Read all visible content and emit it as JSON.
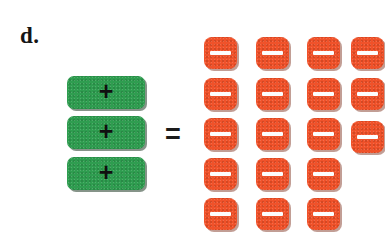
{
  "page": {
    "background_color": "#ffffff",
    "width": 385,
    "height": 248
  },
  "problem": {
    "label": "d.",
    "equals_symbol": "=",
    "description": "algebra tile equation: three positive tiles equal eighteen negative tiles"
  },
  "colors": {
    "positive_tile": "#2f9d50",
    "negative_tile": "#f0522a",
    "positive_sign": "#101010",
    "negative_sign": "#fdfdfd",
    "text": "#151515"
  },
  "left_side": {
    "name": "positive-tile-stack",
    "tile_type": "positive",
    "sign": "+",
    "count": 3,
    "tiles": [
      {
        "sign": "+",
        "left": 67,
        "top": 76
      },
      {
        "sign": "+",
        "left": 67,
        "top": 116
      },
      {
        "sign": "+",
        "left": 67,
        "top": 157
      }
    ]
  },
  "right_side": {
    "name": "negative-tile-grid",
    "tile_type": "negative",
    "sign": "−",
    "count": 18,
    "columns": 4,
    "rows": 5,
    "row_counts": [
      4,
      4,
      4,
      3,
      3
    ],
    "tiles": [
      {
        "sign": "−",
        "left": 204,
        "top": 37
      },
      {
        "sign": "−",
        "left": 256,
        "top": 37
      },
      {
        "sign": "−",
        "left": 307,
        "top": 37
      },
      {
        "sign": "−",
        "left": 351,
        "top": 37
      },
      {
        "sign": "−",
        "left": 204,
        "top": 78
      },
      {
        "sign": "−",
        "left": 256,
        "top": 78
      },
      {
        "sign": "−",
        "left": 307,
        "top": 78
      },
      {
        "sign": "−",
        "left": 351,
        "top": 78
      },
      {
        "sign": "−",
        "left": 204,
        "top": 118
      },
      {
        "sign": "−",
        "left": 256,
        "top": 118
      },
      {
        "sign": "−",
        "left": 307,
        "top": 118
      },
      {
        "sign": "−",
        "left": 351,
        "top": 121
      },
      {
        "sign": "−",
        "left": 204,
        "top": 158
      },
      {
        "sign": "−",
        "left": 256,
        "top": 158
      },
      {
        "sign": "−",
        "left": 307,
        "top": 158
      },
      {
        "sign": "−",
        "left": 204,
        "top": 198
      },
      {
        "sign": "−",
        "left": 256,
        "top": 198
      },
      {
        "sign": "−",
        "left": 307,
        "top": 198
      }
    ]
  }
}
